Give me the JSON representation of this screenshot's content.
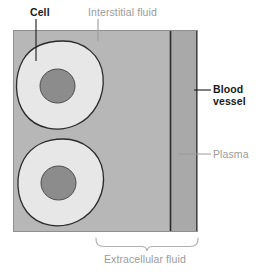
{
  "figure": {
    "labels": {
      "cell": "Cell",
      "interstitial_fluid": "Interstitial fluid",
      "blood_vessel_line1": "Blood",
      "blood_vessel_line2": "vessel",
      "plasma": "Plasma",
      "extracellular_fluid": "Extracellular fluid"
    },
    "colors": {
      "interstitial_fluid_fill": "#b7b7b7",
      "cell_fill": "#e6e6e6",
      "nucleus_fill": "#8c8c8c",
      "blood_vessel_fill": "#a8a8a8",
      "outline": "#2b2b2b",
      "label_dark": "#1a1a1a",
      "label_gray": "#9b9b9b",
      "leader_dark": "#1a1a1a",
      "leader_gray": "#a6a6a6",
      "background": "#ffffff"
    }
  }
}
